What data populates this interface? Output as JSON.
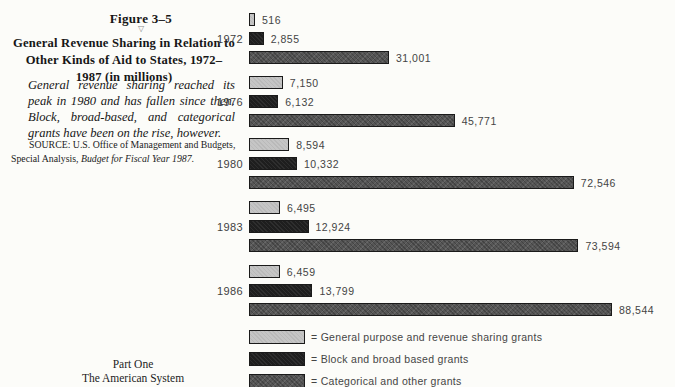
{
  "page": {
    "figure_label": "Figure 3–5",
    "figure_pointer": "▽",
    "title": "General Revenue Sharing in Relation to\nOther Kinds of Aid to States, 1972–\n1987 (in millions)",
    "note": "General revenue sharing reached its peak in 1980 and has fallen since then. Block, broad-based, and categorical grants have been on the rise, however.",
    "source_prefix": "SOURCE: U.S. Office of Management and Budgets, Special Analysis, ",
    "source_italic": "Budget for Fiscal Year 1987",
    "source_suffix": ".",
    "footer": "Part One\nThe American System"
  },
  "chart_data": {
    "type": "bar",
    "orientation": "horizontal",
    "categories": [
      "1972",
      "1976",
      "1980",
      "1983",
      "1986"
    ],
    "series": [
      {
        "name": "General purpose and revenue sharing grants",
        "color": "#c5c5c5",
        "values": [
          516,
          7150,
          8594,
          6495,
          6459
        ],
        "labels": [
          "516",
          "7,150",
          "8,594",
          "6,495",
          "6,459"
        ]
      },
      {
        "name": "Block and broad based grants",
        "color": "#1e1e1e",
        "values": [
          2855,
          6132,
          10332,
          12924,
          13799
        ],
        "labels": [
          "2,855",
          "6,132",
          "10,332",
          "12,924",
          "13,799"
        ]
      },
      {
        "name": "Categorical and other grants",
        "color": "#565656",
        "values": [
          31001,
          45771,
          72546,
          73594,
          88544
        ],
        "labels": [
          "31,001",
          "45,771",
          "72,546",
          "73,594",
          "88,544"
        ]
      }
    ],
    "xlim": [
      0,
      90000
    ],
    "grid": false,
    "legend_position": "bottom"
  },
  "legend": {
    "items": [
      {
        "eq": "=",
        "label": "General purpose and revenue sharing grants",
        "color": "#c5c5c5"
      },
      {
        "eq": "=",
        "label": "Block and broad based grants",
        "color": "#1e1e1e"
      },
      {
        "eq": "=",
        "label": "Categorical and other grants",
        "color": "#565656"
      }
    ]
  }
}
